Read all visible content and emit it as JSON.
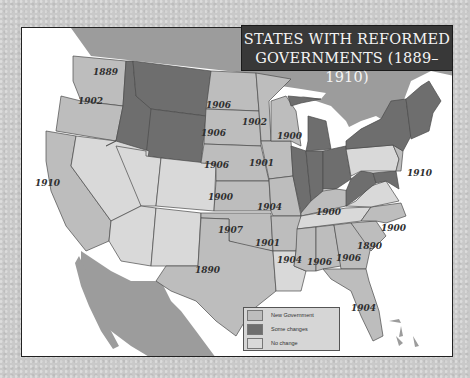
{
  "title": {
    "line1": "STATES WITH REFORMED",
    "line2": "GOVERNMENTS (1889–1910)"
  },
  "colors": {
    "new_government": "#bdbdbd",
    "some_changes": "#6e6e6e",
    "no_change": "#d9d9d9",
    "foreign_land": "#9c9c9c",
    "water": "#ffffff",
    "title_bg": "#383838"
  },
  "legend": {
    "items": [
      {
        "label": "New Government",
        "color": "#bdbdbd"
      },
      {
        "label": "Some changes",
        "color": "#6e6e6e"
      },
      {
        "label": "No change",
        "color": "#d9d9d9"
      }
    ]
  },
  "states": {
    "washington": {
      "status": "New Government",
      "year": "1889"
    },
    "oregon": {
      "status": "New Government",
      "year": "1902"
    },
    "california": {
      "status": "New Government",
      "year": "1910"
    },
    "idaho": {
      "status": "Some changes"
    },
    "montana": {
      "status": "Some changes"
    },
    "wyoming": {
      "status": "Some changes"
    },
    "nevada": {
      "status": "No change"
    },
    "utah": {
      "status": "No change"
    },
    "colorado": {
      "status": "No change"
    },
    "arizona": {
      "status": "No change"
    },
    "new_mexico": {
      "status": "No change"
    },
    "north_dakota": {
      "status": "New Government",
      "year": "1906"
    },
    "south_dakota": {
      "status": "New Government",
      "year": "1906"
    },
    "nebraska": {
      "status": "New Government",
      "year": "1906"
    },
    "kansas": {
      "status": "New Government",
      "year": "1900"
    },
    "oklahoma": {
      "status": "New Government",
      "year": "1907"
    },
    "texas": {
      "status": "New Government",
      "year": "1890"
    },
    "minnesota": {
      "status": "New Government",
      "year": "1902"
    },
    "iowa": {
      "status": "New Government",
      "year": "1901"
    },
    "missouri": {
      "status": "New Government",
      "year": "1904"
    },
    "arkansas": {
      "status": "New Government",
      "year": "1901"
    },
    "louisiana": {
      "status": "No change"
    },
    "wisconsin": {
      "status": "New Government",
      "year": "1900"
    },
    "michigan": {
      "status": "Some changes"
    },
    "illinois": {
      "status": "Some changes"
    },
    "indiana": {
      "status": "Some changes"
    },
    "ohio": {
      "status": "Some changes"
    },
    "kentucky": {
      "status": "New Government",
      "year": "1900"
    },
    "tennessee": {
      "status": "No change"
    },
    "mississippi": {
      "status": "New Government",
      "year": "1904"
    },
    "alabama": {
      "status": "New Government",
      "year": "1906"
    },
    "georgia": {
      "status": "New Government",
      "year": "1906"
    },
    "florida": {
      "status": "New Government",
      "year": "1904"
    },
    "south_carolina": {
      "status": "New Government",
      "year": "1890"
    },
    "north_carolina": {
      "status": "New Government",
      "year": "1900"
    },
    "virginia": {
      "status": "No change"
    },
    "west_virginia": {
      "status": "Some changes"
    },
    "maryland": {
      "status": "Some changes"
    },
    "new_jersey": {
      "status": "New Government",
      "year": "1910"
    },
    "pennsylvania": {
      "status": "No change"
    },
    "new_york": {
      "status": "Some changes"
    },
    "new_england": {
      "status": "Some changes"
    }
  }
}
